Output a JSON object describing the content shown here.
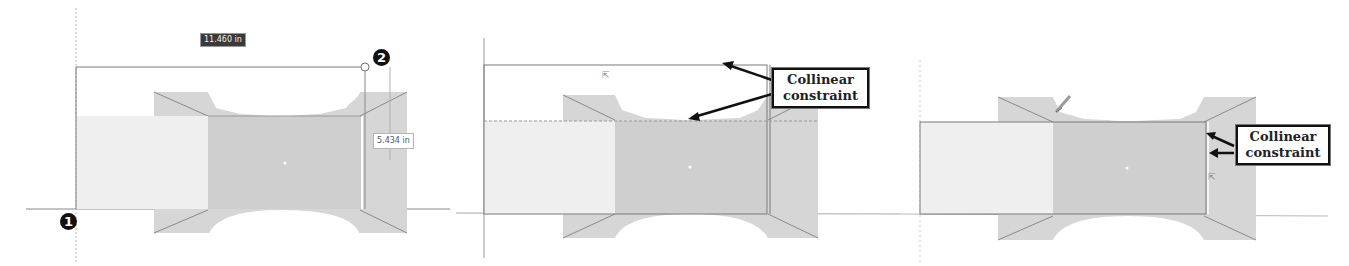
{
  "figure": {
    "panels": [
      {
        "id": "step-1",
        "dimension_width": "11.460 in",
        "dimension_height": "5.434 in",
        "point_markers": [
          "1",
          "2"
        ]
      },
      {
        "id": "step-2",
        "callout": {
          "line1": "Collinear",
          "line2": "constraint"
        },
        "cursor_glyph": "⇱"
      },
      {
        "id": "step-3",
        "callout": {
          "line1": "Collinear",
          "line2": "constraint"
        },
        "cursor_glyph": "⇱"
      }
    ],
    "colors": {
      "part_fill": "#d4d4d4",
      "part_dark": "#c2c2c2",
      "rect_fill": "#ececec",
      "line": "#6a6a6a",
      "axis": "#9a9a9a",
      "callout_border": "#111111"
    }
  }
}
